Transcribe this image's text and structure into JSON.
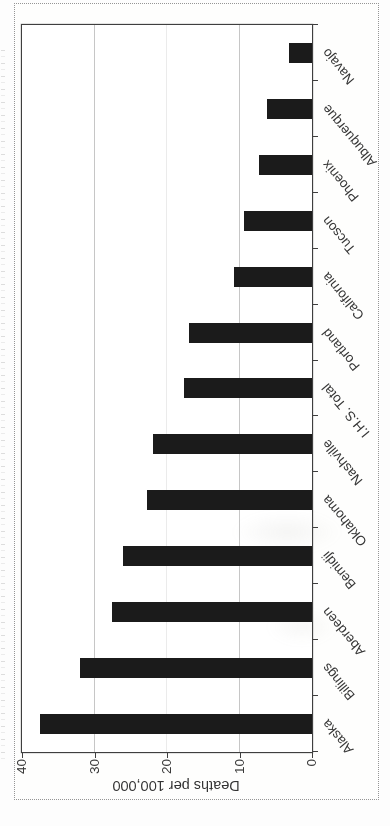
{
  "chart_data": {
    "type": "bar",
    "title": "",
    "categories": [
      "Alaska",
      "Billings",
      "Aberdeen",
      "Bemidji",
      "Oklahoma",
      "Nashville",
      "I.H.S. Total",
      "Portland",
      "California",
      "Tucson",
      "Phoenix",
      "Albuquerque",
      "Navajo"
    ],
    "values": [
      37.5,
      32.0,
      27.6,
      26.1,
      22.8,
      21.9,
      17.6,
      17.0,
      10.8,
      9.4,
      7.3,
      6.2,
      3.2
    ],
    "xlabel": "",
    "ylabel": "Deaths per 100,000",
    "ylim": [
      0,
      40
    ],
    "yticks": [
      0,
      10,
      20,
      30,
      40
    ],
    "gridlines": [
      10,
      20,
      30
    ],
    "legend": "none",
    "grid": "major-horizontal",
    "bar_color": "#1b1b1b",
    "category_label_angle_deg": -40,
    "presentation": "vertical bar chart scanned and displayed rotated 90 degrees counter-clockwise inside a dotted frame"
  }
}
